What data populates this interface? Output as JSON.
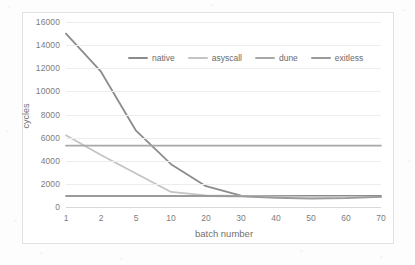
{
  "chart_data": {
    "type": "line",
    "title": "",
    "xlabel": "batch number",
    "ylabel": "cycles",
    "categories": [
      "1",
      "2",
      "5",
      "10",
      "20",
      "30",
      "40",
      "50",
      "60",
      "70"
    ],
    "ylim": [
      0,
      16000
    ],
    "yticks": [
      "0",
      "2000",
      "4000",
      "6000",
      "8000",
      "10000",
      "12000",
      "14000",
      "16000"
    ],
    "ytick_values": [
      0,
      2000,
      4000,
      6000,
      8000,
      10000,
      12000,
      14000,
      16000
    ],
    "grid": "horizontal",
    "legend_position": "inside-top-center",
    "series": [
      {
        "name": "native",
        "color": "#8c8c8c",
        "values": [
          15000,
          11700,
          6600,
          3700,
          1800,
          980,
          950,
          950,
          950,
          950
        ]
      },
      {
        "name": "asyscall",
        "color": "#c4c4c4",
        "values": [
          6200,
          4500,
          2900,
          1300,
          1000,
          950,
          900,
          880,
          870,
          880
        ]
      },
      {
        "name": "dune",
        "color": "#a8a8a8",
        "values": [
          5300,
          5300,
          5300,
          5300,
          5300,
          5300,
          5300,
          5300,
          5300,
          5300
        ]
      },
      {
        "name": "exitless",
        "color": "#9a9a9a",
        "values": [
          950,
          950,
          950,
          950,
          950,
          930,
          800,
          720,
          760,
          880
        ]
      }
    ]
  },
  "legend": {
    "items": [
      {
        "label": "native"
      },
      {
        "label": "asyscall"
      },
      {
        "label": "dune"
      },
      {
        "label": "exitless"
      }
    ]
  },
  "colors": {
    "grid": "#ededed",
    "frame": "#e2e2e2",
    "tick_text": "#7d7d7d",
    "axis_title": "#6f6f6f",
    "background": "#ffffff"
  }
}
